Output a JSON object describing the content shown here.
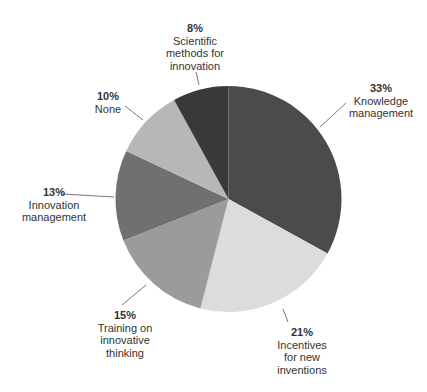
{
  "chart_data": {
    "type": "pie",
    "title": "",
    "start_angle_deg": 0,
    "direction": "clockwise",
    "slices": [
      {
        "label": "Knowledge management",
        "value": 33,
        "pct_label": "33%",
        "color": "#4b4b4b"
      },
      {
        "label": "Incentives for new inventions",
        "value": 21,
        "pct_label": "21%",
        "color": "#dcdcdc"
      },
      {
        "label": "Training on innovative thinking",
        "value": 15,
        "pct_label": "15%",
        "color": "#9b9b9b"
      },
      {
        "label": "Innovation management",
        "value": 13,
        "pct_label": "13%",
        "color": "#707070"
      },
      {
        "label": "None",
        "value": 10,
        "pct_label": "10%",
        "color": "#b7b7b7"
      },
      {
        "label": "Scientific methods for innovation",
        "value": 8,
        "pct_label": "8%",
        "color": "#393939"
      }
    ],
    "legend": "none (direct labels with leader lines)"
  },
  "labels": {
    "knowledge": {
      "pct": "33%",
      "text": "Knowledge\nmanagement"
    },
    "incentives": {
      "pct": "21%",
      "text": "Incentives\nfor new\ninventions"
    },
    "training": {
      "pct": "15%",
      "text": "Training on\ninnovative\nthinking"
    },
    "innovation": {
      "pct": "13%",
      "text": "Innovation\nmanagement"
    },
    "none": {
      "pct": "10%",
      "text": "None"
    },
    "scientific": {
      "pct": "8%",
      "text": "Scientific\nmethods for\ninnovation"
    }
  }
}
